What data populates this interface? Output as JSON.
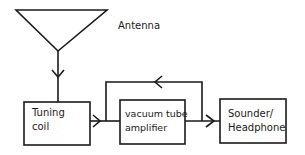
{
  "diagram": {
    "antenna": {
      "label": "Antenna"
    },
    "blocks": [
      {
        "id": "tuning-coil",
        "label": "Tuning\ncoil"
      },
      {
        "id": "amplifier",
        "label": "vacuum tube\namplifier"
      },
      {
        "id": "sounder",
        "label": "Sounder/\nHeadphone"
      }
    ],
    "connections": [
      {
        "from": "antenna",
        "to": "tuning-coil"
      },
      {
        "from": "tuning-coil",
        "to": "amplifier"
      },
      {
        "from": "amplifier",
        "to": "sounder"
      },
      {
        "from": "amplifier-output",
        "to": "amplifier-input",
        "type": "feedback"
      }
    ],
    "colors": {
      "stroke": "#1a1a1a",
      "background": "#ffffff"
    }
  }
}
